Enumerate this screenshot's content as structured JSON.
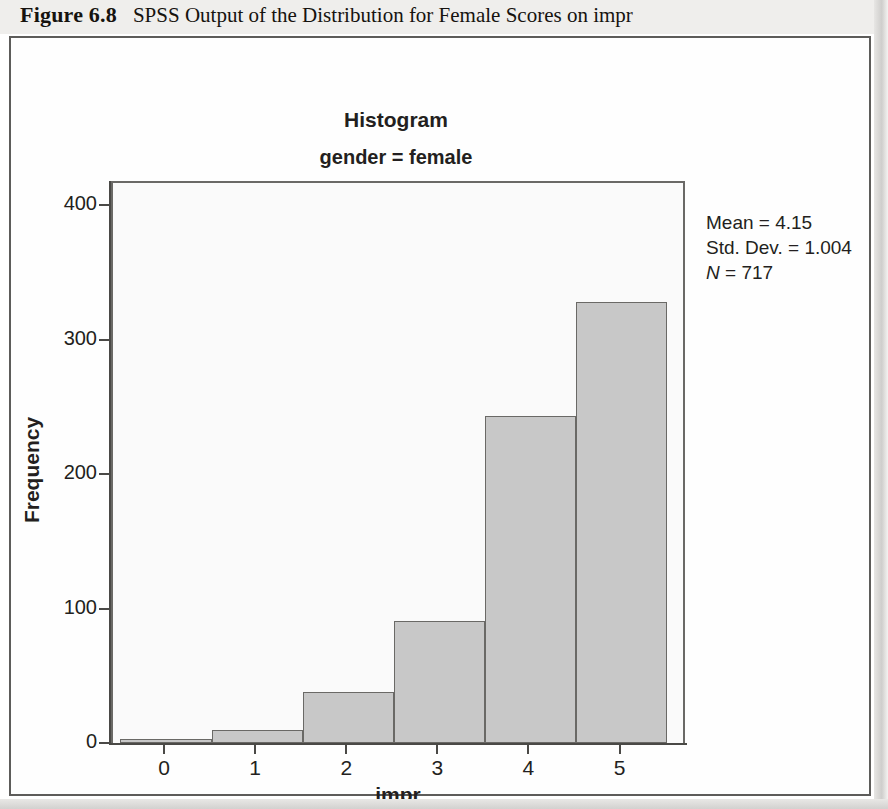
{
  "caption": {
    "label": "Figure 6.8",
    "title": "SPSS Output of the Distribution for Female Scores on impr"
  },
  "chart_data": {
    "type": "bar",
    "title": "Histogram",
    "subtitle": "gender = female",
    "xlabel": "impr",
    "ylabel": "Frequency",
    "categories": [
      "0",
      "1",
      "2",
      "3",
      "4",
      "5"
    ],
    "values": [
      3,
      10,
      38,
      91,
      243,
      328
    ],
    "ytick_labels": [
      "0",
      "100",
      "200",
      "300",
      "400"
    ],
    "ytick_values": [
      0,
      100,
      200,
      300,
      400
    ],
    "ylim": [
      0,
      418
    ],
    "xlim": [
      -0.5,
      5.8
    ],
    "grid": false,
    "legend": "none",
    "bar_fill": "#c8c8c8",
    "bar_edge": "#6a6966",
    "plot_background": "#fafafa",
    "annotations": {
      "mean_label": "Mean = 4.15",
      "std_label": "Std. Dev. = 1.004",
      "n_label": "N = 717",
      "n_symbol": "N",
      "n_value": "= 717"
    }
  }
}
